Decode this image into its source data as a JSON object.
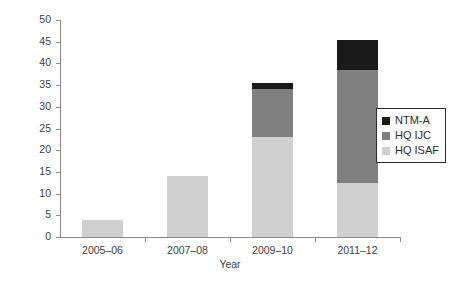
{
  "chart_data": {
    "type": "bar",
    "subtype": "stacked",
    "title": "",
    "xlabel": "Year",
    "ylabel": "No. of Officers",
    "categories": [
      "2005–06",
      "2007–08",
      "2009–10",
      "2011–12"
    ],
    "series": [
      {
        "name": "HQ ISAF",
        "color": "#d0d0d0",
        "values": [
          4,
          14,
          23,
          12.5
        ]
      },
      {
        "name": "HQ IJC",
        "color": "#808080",
        "values": [
          0,
          0,
          11,
          26
        ]
      },
      {
        "name": "NTM-A",
        "color": "#1a1a1a",
        "values": [
          0,
          0,
          1.5,
          7
        ]
      }
    ],
    "stack_order_bottom_to_top": [
      "HQ ISAF",
      "HQ IJC",
      "NTM-A"
    ],
    "totals": [
      4,
      14,
      35.5,
      45.5
    ],
    "ylim": [
      0,
      50
    ],
    "yticks": [
      0,
      5,
      10,
      15,
      20,
      25,
      30,
      35,
      40,
      45,
      50
    ],
    "ytick_labels": [
      "0",
      "5",
      "10",
      "15",
      "20",
      "25",
      "30",
      "35",
      "40",
      "45",
      "50"
    ],
    "grid": false,
    "legend_position": "right",
    "legend_entries": [
      {
        "label": "NTM-A",
        "color": "#1a1a1a"
      },
      {
        "label": "HQ IJC",
        "color": "#808080"
      },
      {
        "label": "HQ ISAF",
        "color": "#d0d0d0"
      }
    ]
  }
}
